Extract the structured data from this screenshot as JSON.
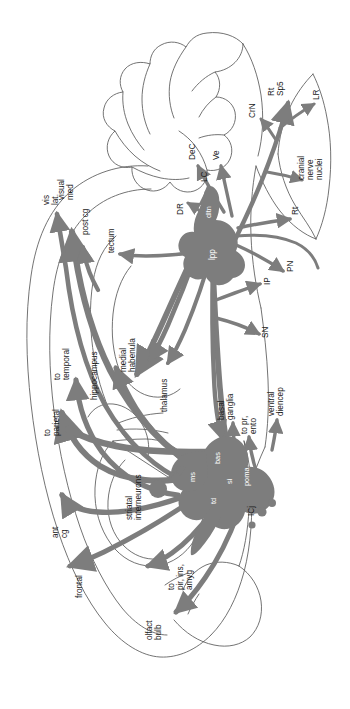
{
  "figure": {
    "orientation_note": "diagram rotated 90 degrees; all text reads bottom-to-top"
  },
  "colors": {
    "pathway": "#7d7d7d",
    "outline": "#5a5a5a",
    "nucleus_fill": "#7d7d7d",
    "label_text": "#1a1a1a",
    "label_text_inverse": "#ffffff",
    "background": "#ffffff"
  },
  "labels": {
    "cortical": {
      "vis_lat": "vis\nlat",
      "visual_med": "visual\nmed",
      "post_cg": "post cg",
      "to_temporal": "to\ntemporal",
      "to_parietal": "to\nparietal",
      "ant_cg": "ant\ncg",
      "frontal": "frontal",
      "hippocampus": "hippocampus",
      "olfact_bulb": "olfact\nbulb",
      "to_pir_ins_amyg": "to\npir, ins,\namyg"
    },
    "subcortical": {
      "tectum": "tectum",
      "medial_habenula": "medial\nhabenula",
      "thalamus": "thalamus",
      "basal_ganglia": "basal\nganglia",
      "to_pr_ento": "to pr,\nento",
      "ventral_diencep": "ventral\ndiencep",
      "striatal_interneurons": "striatal\ninterneurons",
      "icj": "ICj"
    },
    "brainstem": {
      "dr": "DR",
      "lc": "LC",
      "dec": "DeC",
      "ve": "Ve",
      "crn": "CrN",
      "rt_sp5": "Rt\nSp5",
      "lr": "LR",
      "cranial_nerve_nuclei": "cranial\nnerve\nnuclei",
      "rt": "Rt",
      "pn": "PN",
      "ip": "IP",
      "sn": "SN"
    },
    "nuclei_inline": {
      "dltn": "dltn",
      "lpp": "lpp",
      "ms": "ms",
      "bas": "bas",
      "si": "si",
      "poma": "poma",
      "td": "td"
    }
  },
  "label_list": [
    "vis lat",
    "visual med",
    "post cg",
    "to temporal",
    "to parietal",
    "ant cg",
    "frontal",
    "hippocampus",
    "olfact bulb",
    "to pir, ins, amyg",
    "tectum",
    "medial habenula",
    "thalamus",
    "basal ganglia",
    "to pr, ento",
    "ventral diencep",
    "striatal interneurons",
    "ICj",
    "DR",
    "LC",
    "DeC",
    "Ve",
    "CrN",
    "Rt Sp5",
    "LR",
    "cranial nerve nuclei",
    "Rt",
    "PN",
    "IP",
    "SN",
    "dltn",
    "lpp",
    "ms",
    "bas",
    "si",
    "poma",
    "td"
  ]
}
